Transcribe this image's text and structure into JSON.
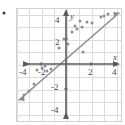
{
  "figure": {
    "background_color": "#ffffff",
    "frame_color": "#d2d2d2",
    "grid_color": "#dcdcdc",
    "axis_color": "#5a5a5a",
    "point_color": "#8d8d95",
    "line_color": "#8d8d95"
  },
  "chart_data": {
    "type": "scatter",
    "title": "",
    "subtitle": "",
    "xlabel": "x",
    "ylabel": "y",
    "xlim": [
      -4.6,
      4.6
    ],
    "ylim": [
      -4.6,
      4.6
    ],
    "grid": true,
    "legend": null,
    "legend_position": "none",
    "x_ticks": [
      -4,
      -2,
      2,
      4
    ],
    "y_ticks": [
      -4,
      -2,
      2,
      4
    ],
    "x_tick_labels": [
      "-4",
      "-2",
      "2",
      "4"
    ],
    "y_tick_labels": [
      "4",
      "2",
      "-2",
      "-4"
    ],
    "axis_arrows": [
      "left",
      "right",
      "up",
      "down"
    ],
    "series": [
      {
        "name": "data points",
        "type": "scatter",
        "marker": "circle",
        "color": "#8d8d95",
        "points": [
          [
            -3.4,
            -2.5
          ],
          [
            -3.0,
            -2.2
          ],
          [
            -2.6,
            -1.6
          ],
          [
            -2.3,
            -0.5
          ],
          [
            -1.9,
            -0.3
          ],
          [
            -1.7,
            -0.2
          ],
          [
            -1.5,
            -0.6
          ],
          [
            -1.2,
            -0.4
          ],
          [
            -0.6,
            1.3
          ],
          [
            -0.2,
            2.0
          ],
          [
            0.2,
            1.6
          ],
          [
            0.5,
            2.6
          ],
          [
            0.7,
            3.1
          ],
          [
            0.9,
            2.8
          ],
          [
            1.1,
            3.5
          ],
          [
            1.3,
            3.0
          ],
          [
            1.4,
            1.0
          ],
          [
            1.7,
            3.4
          ],
          [
            2.1,
            3.3
          ],
          [
            2.8,
            3.8
          ],
          [
            3.1,
            3.9
          ],
          [
            3.4,
            4.0
          ]
        ]
      },
      {
        "name": "line of best fit",
        "type": "line",
        "color": "#8d8d95",
        "slope": 1.0,
        "intercept": 1.5,
        "endpoints": [
          [
            -4.4,
            -2.9
          ],
          [
            4.3,
            4.2
          ]
        ]
      }
    ],
    "annotations": []
  },
  "marks": {
    "stray_dot": {
      "name": "bullet-marker",
      "x": 4,
      "y": 13,
      "color": "#3a3a3a"
    }
  }
}
